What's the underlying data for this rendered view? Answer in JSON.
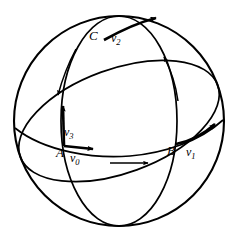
{
  "figure": {
    "background_color": "#ffffff",
    "stroke_color": "#000000",
    "width": 242,
    "height": 239
  },
  "points": [
    {
      "id": "A",
      "label": "A",
      "x": 62,
      "y": 152
    },
    {
      "id": "B",
      "label": "B",
      "x": 173,
      "y": 150
    },
    {
      "id": "C",
      "label": "C",
      "x": 95,
      "y": 36
    }
  ],
  "vectors": [
    {
      "id": "v0",
      "label": "v",
      "subscript": "0",
      "at_point": "A",
      "direction": "east",
      "x": 76,
      "y": 158
    },
    {
      "id": "v1",
      "label": "v",
      "subscript": "1",
      "at_point": "B",
      "direction": "northeast",
      "x": 190,
      "y": 152
    },
    {
      "id": "v2",
      "label": "v",
      "subscript": "2",
      "at_point": "C",
      "direction": "northeast",
      "x": 115,
      "y": 38
    },
    {
      "id": "v3",
      "label": "v",
      "subscript": "3",
      "at_point": "A",
      "direction": "north",
      "x": 68,
      "y": 131
    }
  ],
  "direction_arrows": [
    {
      "id": "equator-direction",
      "style": "straight",
      "orientation": "east",
      "near": "equator"
    },
    {
      "id": "left-meridian-direction",
      "style": "curved",
      "orientation": "south",
      "near": "left-great-circle"
    },
    {
      "id": "right-meridian-direction",
      "style": "curved",
      "orientation": "north",
      "near": "right-great-circle"
    }
  ],
  "curves": [
    {
      "id": "sphere-outline",
      "type": "circle",
      "cx": 119,
      "cy": 121,
      "r": 105
    },
    {
      "id": "equator",
      "type": "ellipse-arc",
      "description": "horizontal great circle seen edge-on, front half"
    },
    {
      "id": "meridian",
      "type": "ellipse",
      "description": "vertical great circle through the poles"
    },
    {
      "id": "tilted-great-circle",
      "type": "ellipse",
      "description": "inclined great circle passing through C"
    }
  ],
  "colors": {
    "stroke": "#000000",
    "background": "#ffffff"
  }
}
